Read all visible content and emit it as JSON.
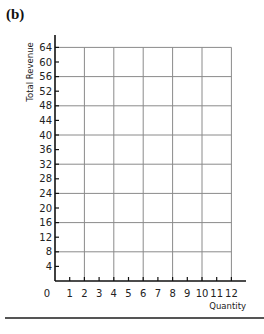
{
  "panel_label": "(b)",
  "chart_data": {
    "type": "line",
    "title": "",
    "xlabel": "Quantity",
    "ylabel": "Total Revenue",
    "xlim": [
      0,
      12
    ],
    "ylim": [
      0,
      64
    ],
    "x_ticks": [
      "0",
      "1",
      "2",
      "3",
      "4",
      "5",
      "6",
      "7",
      "8",
      "9",
      "10",
      "11",
      "12"
    ],
    "y_ticks": [
      "4",
      "8",
      "12",
      "16",
      "20",
      "24",
      "28",
      "32",
      "36",
      "40",
      "44",
      "48",
      "52",
      "56",
      "60",
      "64"
    ],
    "grid": {
      "x_every": 2,
      "y_every": 8,
      "on": true
    },
    "series": []
  },
  "colors": {
    "axis": "#111111",
    "grid": "#8a8a8a",
    "rule": "#555555"
  }
}
